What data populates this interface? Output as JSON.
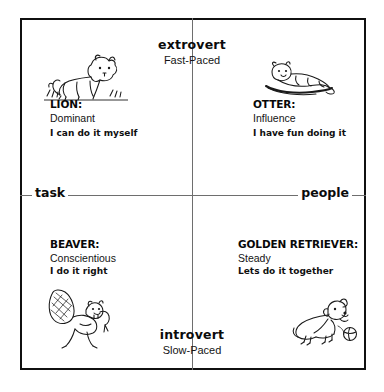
{
  "diagram": {
    "frame": {
      "border_color": "#101010",
      "background": "#ffffff"
    },
    "axes": {
      "vertical": {
        "top": {
          "pole": "extrovert",
          "pace": "Fast-Paced"
        },
        "bottom": {
          "pole": "introvert",
          "pace": "Slow-Paced"
        }
      },
      "horizontal": {
        "left": "task",
        "right": "people"
      },
      "line_color": "#6e6e6e"
    },
    "quadrants": [
      {
        "id": "lion",
        "position": "top-left",
        "title": "LION:",
        "trait": "Dominant",
        "motto": "I can do it myself",
        "icon": "lion-cub-icon"
      },
      {
        "id": "otter",
        "position": "top-right",
        "title": "OTTER:",
        "trait": "Influence",
        "motto": "I have fun doing it",
        "icon": "otter-icon"
      },
      {
        "id": "beaver",
        "position": "bottom-left",
        "title": "BEAVER:",
        "trait": "Conscientious",
        "motto": "I do it right",
        "icon": "beaver-icon"
      },
      {
        "id": "golden-retriever",
        "position": "bottom-right",
        "title": "GOLDEN RETRIEVER:",
        "trait": "Steady",
        "motto": "Lets do it together",
        "icon": "golden-retriever-icon"
      }
    ]
  }
}
